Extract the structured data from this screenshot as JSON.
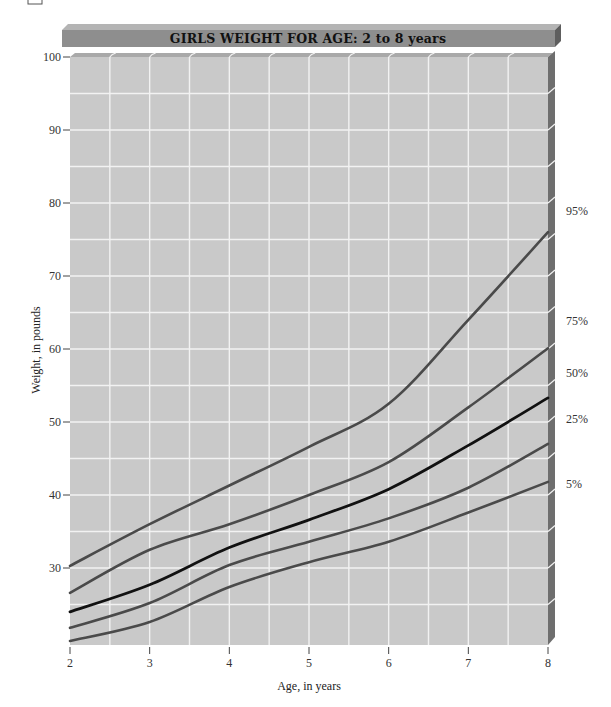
{
  "chart_data": {
    "type": "line",
    "title": "GIRLS WEIGHT FOR AGE: 2 to 8 years",
    "xlabel": "Age, in years",
    "ylabel": "Weight, in pounds",
    "x": [
      2,
      3,
      4,
      5,
      6,
      7,
      8
    ],
    "x_ticks": [
      "2",
      "3",
      "4",
      "5",
      "6",
      "7",
      "8"
    ],
    "y_ticks": [
      "30",
      "40",
      "50",
      "60",
      "70",
      "80",
      "90",
      "100"
    ],
    "xlim": [
      2,
      8
    ],
    "ylim": [
      19.5,
      100
    ],
    "grid": true,
    "legend_position": "right-end labels",
    "series": [
      {
        "name": "95%",
        "values": [
          30.3,
          36.0,
          41.3,
          46.6,
          52.5,
          64.0,
          76.0
        ],
        "color": "#4a4a4a"
      },
      {
        "name": "75%",
        "values": [
          26.6,
          32.5,
          36.0,
          40.0,
          44.5,
          52.0,
          60.1
        ],
        "color": "#4a4a4a"
      },
      {
        "name": "50%",
        "values": [
          24.0,
          27.7,
          32.8,
          36.6,
          40.8,
          46.8,
          53.3
        ],
        "color": "#111111"
      },
      {
        "name": "25%",
        "values": [
          21.8,
          25.2,
          30.4,
          33.6,
          36.8,
          41.0,
          47.0
        ],
        "color": "#4a4a4a"
      },
      {
        "name": "5%",
        "values": [
          20.0,
          22.6,
          27.4,
          30.8,
          33.6,
          37.6,
          41.8
        ],
        "color": "#4a4a4a"
      }
    ]
  },
  "colors": {
    "plot_face": "#c9c9c9",
    "plot_top_bevel": "#a9a9a9",
    "plot_side_bevel": "#6e6e6e",
    "grid": "#f2f2f2",
    "title_face": "#8e8e8e",
    "title_top": "#b4b4b4",
    "title_side": "#5e5e5e"
  }
}
